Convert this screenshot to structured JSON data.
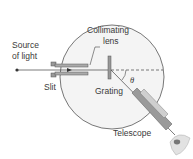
{
  "diagram": {
    "labels": {
      "source_line1": "Source",
      "source_line2": "of light",
      "collimating_line1": "Collimating",
      "collimating_line2": "lens",
      "slit": "Slit",
      "grating": "Grating",
      "angle": "θ",
      "telescope": "Telescope"
    },
    "colors": {
      "circle_fill": "#f4f4f4",
      "stroke": "#555555",
      "tube": "#8a8a8a",
      "eye": "#c8c8c8"
    }
  }
}
